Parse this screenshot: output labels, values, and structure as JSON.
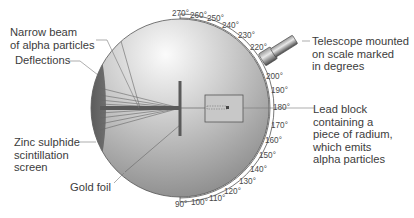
{
  "diagram": {
    "labels": {
      "narrow_beam": [
        "Narrow beam",
        "of alpha particles"
      ],
      "deflections": "Deflections",
      "zinc_sulphide": [
        "Zinc sulphide",
        "scintillation",
        "screen"
      ],
      "gold_foil": "Gold foil",
      "telescope": [
        "Telescope mounted",
        "on scale marked",
        "in degrees"
      ],
      "lead_block": [
        "Lead block",
        "containing a",
        "piece of radium,",
        "which emits",
        "alpha particles"
      ]
    },
    "scale_degrees": [
      "270°",
      "260°",
      "250°",
      "240°",
      "230°",
      "220°",
      "200°",
      "190°",
      "180°",
      "170°",
      "160°",
      "150°",
      "140°",
      "130°",
      "120°",
      "110°",
      "100°",
      "90°"
    ],
    "colors": {
      "sphere_light": "#f2f2f2",
      "sphere_dark": "#8c8c8c",
      "screen": "#5e5e5e",
      "lines": "#555555"
    }
  }
}
